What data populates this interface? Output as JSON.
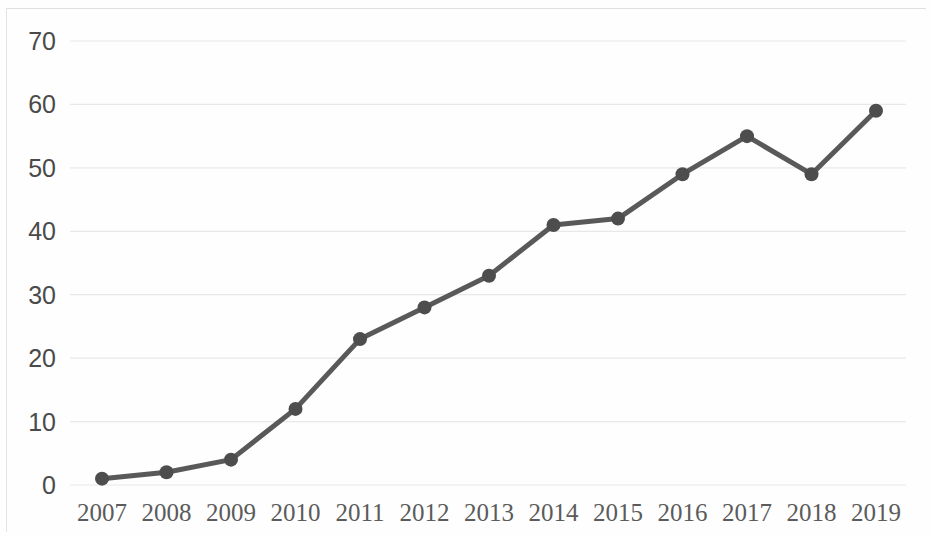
{
  "chart_data": {
    "type": "line",
    "title": "",
    "subtitle": "",
    "xlabel": "",
    "ylabel": "",
    "categories": [
      "2007",
      "2008",
      "2009",
      "2010",
      "2011",
      "2012",
      "2013",
      "2014",
      "2015",
      "2016",
      "2017",
      "2018",
      "2019"
    ],
    "values": [
      1,
      2,
      4,
      12,
      23,
      28,
      33,
      41,
      42,
      49,
      55,
      49,
      59
    ],
    "series": [
      {
        "name": "",
        "values": [
          1,
          2,
          4,
          12,
          23,
          28,
          33,
          41,
          42,
          49,
          55,
          49,
          59
        ]
      }
    ],
    "ylim": [
      0,
      70
    ],
    "ytick_labels": [
      "0",
      "10",
      "20",
      "30",
      "40",
      "50",
      "60",
      "70"
    ],
    "ytick_values": [
      0,
      10,
      20,
      30,
      40,
      50,
      60,
      70
    ],
    "xtick_labels": [
      "2007",
      "2008",
      "2009",
      "2010",
      "2011",
      "2012",
      "2013",
      "2014",
      "2015",
      "2016",
      "2017",
      "2018",
      "2019"
    ],
    "grid": true,
    "grid_axis": "y",
    "legend": false,
    "legend_position": "none",
    "annotations": [],
    "colors": {
      "line": "#595959",
      "marker": "#4d4d4d",
      "grid": "#e8e8e8",
      "tick_text": "#4a4a4a",
      "xtick_text": "#5b5b5b",
      "background": "#fefefe",
      "frame": "#e3e3e3"
    },
    "style": {
      "line_width": 5,
      "marker_shape": "circle",
      "marker_radius": 7
    }
  }
}
